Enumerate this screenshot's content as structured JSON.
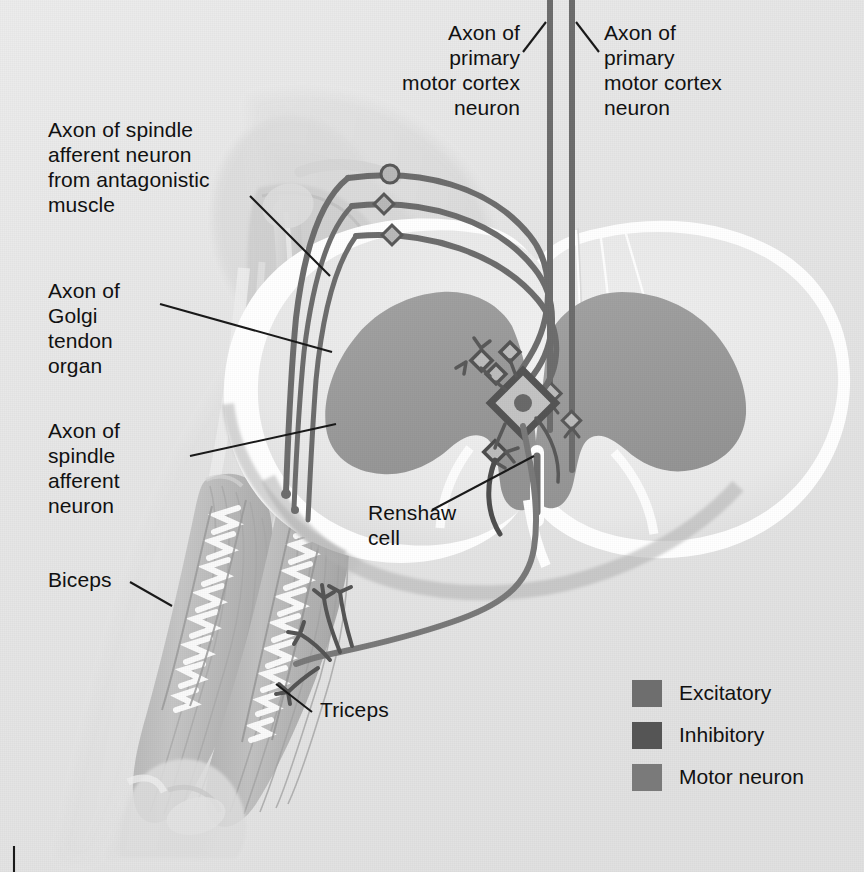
{
  "figure": {
    "background_color": "#e7e7e7"
  },
  "labels": {
    "axon_motor_cortex_left": "Axon of\nprimary\nmotor cortex\nneuron",
    "axon_motor_cortex_right": "Axon of\nprimary\nmotor cortex\nneuron",
    "axon_spindle_antagonistic": "Axon of spindle\nafferent neuron\nfrom antagonistic\nmuscle",
    "axon_golgi_tendon": "Axon of\nGolgi\ntendon\norgan",
    "axon_spindle_afferent": "Axon of\nspindle\nafferent\nneuron",
    "renshaw_cell": "Renshaw\ncell",
    "biceps": "Biceps",
    "triceps": "Triceps"
  },
  "legend": {
    "items": [
      {
        "label": "Excitatory",
        "color": "#6e6e6e"
      },
      {
        "label": "Inhibitory",
        "color": "#555555"
      },
      {
        "label": "Motor neuron",
        "color": "#7a7a7a"
      }
    ]
  },
  "colors": {
    "background": "#e7e7e7",
    "leader_line": "#1a1a1a",
    "axon_excitatory": "#6e6e6e",
    "axon_inhibitory": "#555555",
    "axon_motor": "#7a7a7a",
    "gray_matter": "#9a9a9a",
    "white_matter": "#ededed",
    "cord_outline": "#ffffff",
    "arm_skin": "#dcdcdc",
    "muscle": "#bdbdbd",
    "bone": "#d4d4d4",
    "text": "#111111"
  },
  "anatomy": {
    "structures": [
      "arm silhouette",
      "biceps muscle",
      "triceps muscle",
      "humerus",
      "scapula",
      "clavicle",
      "elbow joint",
      "muscle spindle (biceps)",
      "muscle spindle (triceps)",
      "spinal cord cross-section",
      "dorsal horn",
      "ventral horn",
      "central canal",
      "ventral median fissure",
      "dorsal median sulcus"
    ]
  }
}
